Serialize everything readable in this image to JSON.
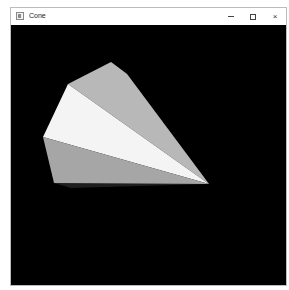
{
  "window": {
    "title": "Cone",
    "controls": {
      "minimize": "minimize",
      "maximize": "maximize",
      "close": "×"
    }
  },
  "viewport": {
    "background": "#000000",
    "object": "cone",
    "faces": [
      {
        "name": "top-face",
        "color": "#b8b8b8"
      },
      {
        "name": "dark-side-face",
        "color": "#3c3c3c"
      },
      {
        "name": "bright-face",
        "color": "#f4f4f4"
      },
      {
        "name": "lower-face",
        "color": "#a6a6a6"
      },
      {
        "name": "bottom-shadow-face",
        "color": "#1e1e1e"
      }
    ]
  }
}
